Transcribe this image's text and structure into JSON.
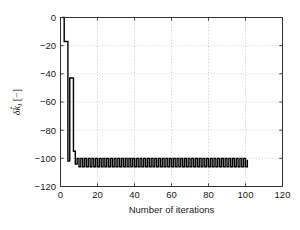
{
  "chart_data": {
    "type": "line",
    "title": "",
    "xlabel": "Number of iterations",
    "ylabel": "δk̂_I [-]",
    "ylabel_parts": {
      "delta": "δ",
      "khat": "k̂",
      "subscript": "I",
      "unit": "[−]"
    },
    "xlim": [
      0,
      120
    ],
    "ylim": [
      -120,
      0
    ],
    "xticks": [
      0,
      20,
      40,
      60,
      80,
      100,
      120
    ],
    "xtick_labels": [
      "0",
      "20",
      "40",
      "60",
      "80",
      "100",
      "120"
    ],
    "yticks": [
      -120,
      -100,
      -80,
      -60,
      -40,
      -20,
      0
    ],
    "ytick_labels": [
      "-120",
      "-100",
      "-80",
      "-60",
      "-40",
      "-20",
      "0"
    ],
    "grid": true,
    "grid_style": "dotted",
    "grid_color": "#b4b4b4",
    "line_color": "#000000",
    "line_width": 1.4,
    "drawstyle": "steps-post",
    "legend": null,
    "series": [
      {
        "name": "delta k_I",
        "x": [
          1,
          2,
          3,
          4,
          5,
          6,
          7,
          8,
          9,
          10,
          11,
          12,
          13,
          14,
          15,
          16,
          17,
          18,
          19,
          20,
          21,
          22,
          23,
          24,
          25,
          26,
          27,
          28,
          29,
          30,
          31,
          32,
          33,
          34,
          35,
          36,
          37,
          38,
          39,
          40,
          41,
          42,
          43,
          44,
          45,
          46,
          47,
          48,
          49,
          50,
          51,
          52,
          53,
          54,
          55,
          56,
          57,
          58,
          59,
          60,
          61,
          62,
          63,
          64,
          65,
          66,
          67,
          68,
          69,
          70,
          71,
          72,
          73,
          74,
          75,
          76,
          77,
          78,
          79,
          80,
          81,
          82,
          83,
          84,
          85,
          86,
          87,
          88,
          89,
          90,
          91,
          92,
          93,
          94,
          95,
          96,
          97,
          98,
          99,
          100,
          101
        ],
        "values": [
          0,
          -17,
          -17,
          -102,
          -43,
          -43,
          -95,
          -104,
          -100,
          -106,
          -100,
          -106,
          -100,
          -106,
          -100,
          -106,
          -100,
          -106,
          -100,
          -106,
          -100,
          -106,
          -100,
          -106,
          -100,
          -106,
          -100,
          -106,
          -100,
          -106,
          -100,
          -106,
          -100,
          -106,
          -100,
          -106,
          -100,
          -106,
          -100,
          -106,
          -100,
          -106,
          -100,
          -106,
          -100,
          -106,
          -100,
          -106,
          -100,
          -106,
          -100,
          -106,
          -100,
          -106,
          -100,
          -106,
          -100,
          -106,
          -100,
          -106,
          -100,
          -106,
          -100,
          -106,
          -100,
          -106,
          -100,
          -106,
          -100,
          -106,
          -100,
          -106,
          -100,
          -106,
          -100,
          -106,
          -100,
          -106,
          -100,
          -106,
          -100,
          -106,
          -100,
          -106,
          -100,
          -106,
          -100,
          -106,
          -100,
          -106,
          -100,
          -106,
          -100,
          -106,
          -100,
          -106,
          -100,
          -106,
          -100,
          -106,
          -101
        ]
      }
    ],
    "annotations": []
  },
  "figure": {
    "background": "#ffffff",
    "axes_color": "#333333"
  }
}
